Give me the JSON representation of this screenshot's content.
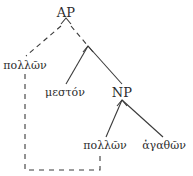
{
  "diagram": {
    "type": "syntax-tree",
    "background_color": "#ffffff",
    "line_color": "#3a3a3a",
    "text_color": "#2b2b2b",
    "nodes": [
      {
        "id": "ap",
        "label": "AP",
        "kind": "category",
        "x": 66,
        "y": 12
      },
      {
        "id": "apex",
        "label": "",
        "kind": "bare-apex",
        "x": 88,
        "y": 48
      },
      {
        "id": "pollon1",
        "label": "πολλῶν",
        "kind": "leaf",
        "x": 25,
        "y": 65
      },
      {
        "id": "meston",
        "label": "μεστόν",
        "kind": "leaf",
        "x": 65,
        "y": 92
      },
      {
        "id": "np",
        "label": "NP",
        "kind": "category",
        "x": 122,
        "y": 92
      },
      {
        "id": "pollon2",
        "label": "πολλῶν",
        "kind": "leaf",
        "x": 105,
        "y": 145
      },
      {
        "id": "agathon",
        "label": "ἀγαθῶν",
        "kind": "leaf",
        "x": 164,
        "y": 145
      }
    ],
    "edges": [
      {
        "id": "e-ap-pollon1",
        "from": "ap",
        "to": "pollon1",
        "style": "dashed"
      },
      {
        "id": "e-ap-apex",
        "from": "ap",
        "to": "apex",
        "style": "dashed"
      },
      {
        "id": "e-apex-meston",
        "from": "apex",
        "to": "meston",
        "style": "solid"
      },
      {
        "id": "e-apex-np",
        "from": "apex",
        "to": "np",
        "style": "solid"
      },
      {
        "id": "e-np-pollon2",
        "from": "np",
        "to": "pollon2",
        "style": "solid"
      },
      {
        "id": "e-np-agathon",
        "from": "np",
        "to": "agathon",
        "style": "solid"
      }
    ],
    "movement_link": {
      "id": "movement-path",
      "style": "dashed",
      "from_node": "pollon1",
      "to_node": "pollon2",
      "description": "dashed connector from left πολλῶν down, across the bottom, and up to the lower πολλῶν"
    },
    "apex_marks": [
      {
        "id": "ap-apex-mark",
        "parent": "ap",
        "glyph": "caret"
      },
      {
        "id": "np-apex-mark",
        "parent": "np",
        "glyph": "caret"
      }
    ]
  }
}
